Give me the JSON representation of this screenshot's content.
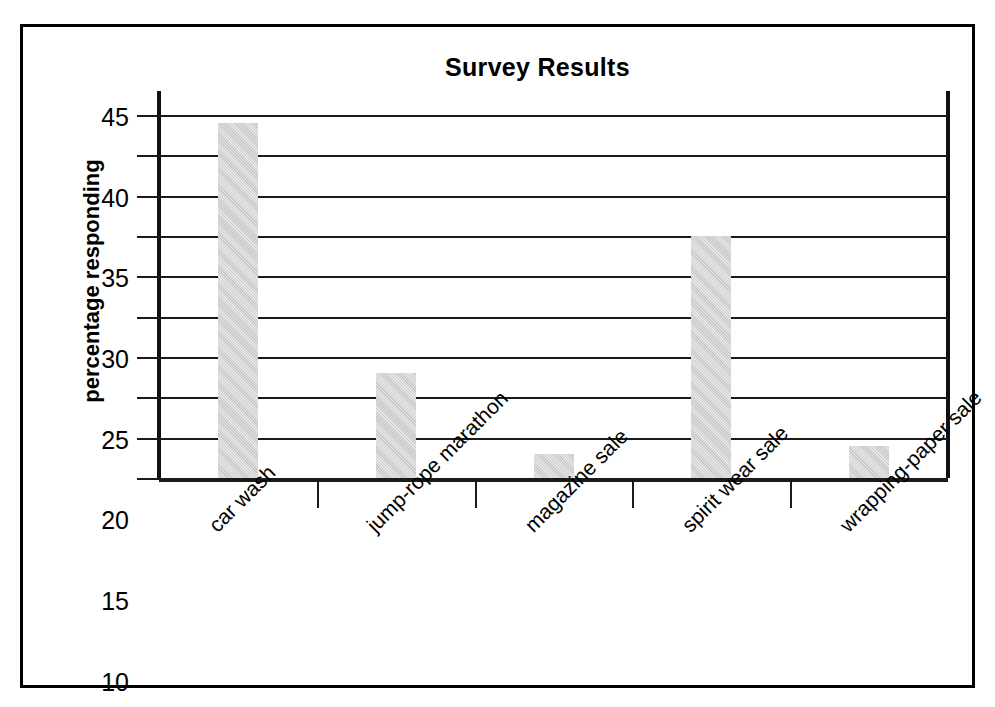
{
  "chart_data": {
    "type": "bar",
    "title": "Survey Results",
    "xlabel": "",
    "ylabel": "percentage responding",
    "categories": [
      "car wash",
      "jump-rope marathon",
      "magazine sale",
      "spirit wear sale",
      "wrapping-paper sale"
    ],
    "values": [
      44,
      13,
      3,
      30,
      4
    ],
    "ylim": [
      0,
      45
    ],
    "yticks": [
      0,
      5,
      10,
      15,
      20,
      25,
      30,
      35,
      40,
      45
    ],
    "ytick_labels": [
      "0",
      "5",
      "10",
      "15",
      "20",
      "25",
      "30",
      "35",
      "40",
      "45"
    ],
    "grid": true,
    "legend": false,
    "bar_color": "#c9c9c9",
    "axis_color": "#111111",
    "background_color": "#ffffff",
    "border_color": "#000000"
  }
}
